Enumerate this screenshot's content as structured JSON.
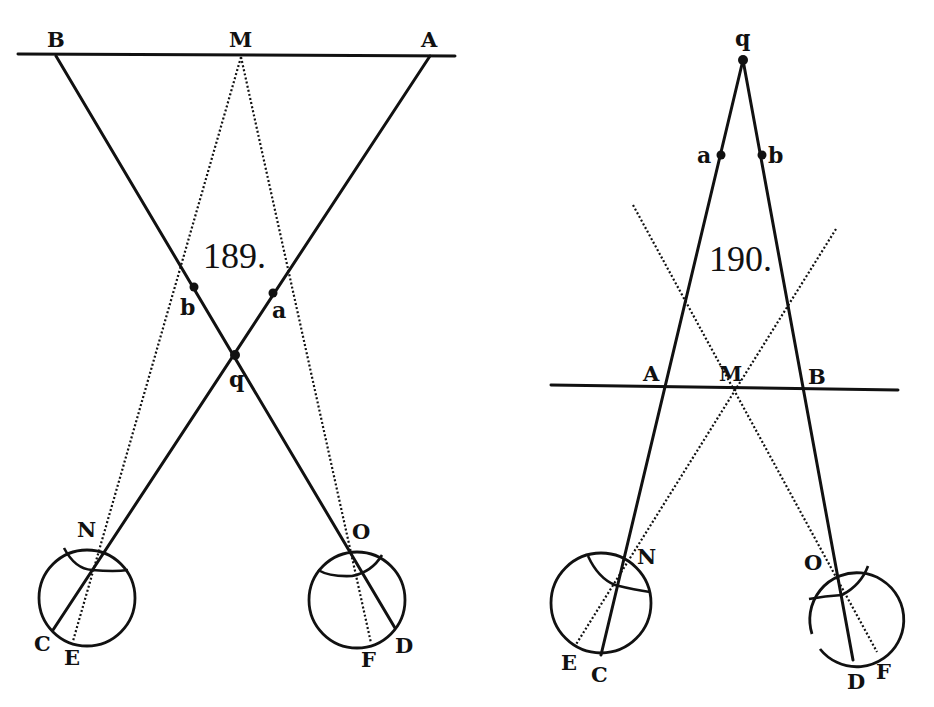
{
  "figures": [
    {
      "number": "189.",
      "labels": {
        "B": "B",
        "M": "M",
        "A": "A",
        "b": "b",
        "a": "a",
        "q": "q",
        "N": "N",
        "O": "O",
        "C": "C",
        "E": "E",
        "F": "F",
        "D": "D"
      },
      "description": "Two eyes N and O converge on point q; solid lines A-q-N-C and B-q-O-D cross at q; dotted lines from M run to E and F; points a and b marked on solid lines."
    },
    {
      "number": "190.",
      "labels": {
        "q": "q",
        "a": "a",
        "b": "b",
        "A": "A",
        "M": "M",
        "B": "B",
        "N": "N",
        "O": "O",
        "E": "E",
        "C": "C",
        "D": "D",
        "F": "F"
      },
      "description": "Two eyes N and O directed at distant point q; solid lines q-A-N-C and q-B-O-D; dotted lines through M cross to E and F."
    }
  ]
}
